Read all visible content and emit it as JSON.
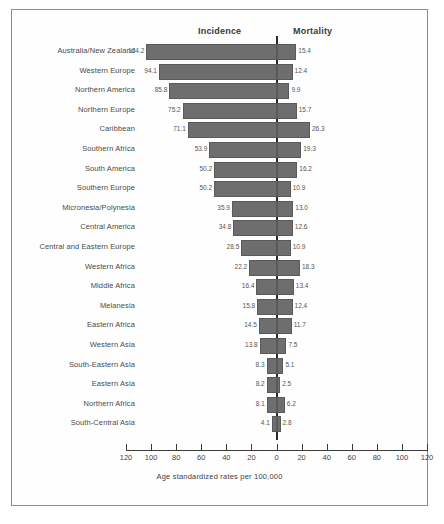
{
  "chart_data": {
    "type": "bar",
    "title": "",
    "subtitle": "",
    "orientation": "horizontal-diverging",
    "xlabel": "Age standardized rates per 100,000",
    "ylabel": "",
    "grid": false,
    "legend_position": "top",
    "axis_ticks": [
      "120",
      "100",
      "80",
      "60",
      "40",
      "20",
      "0",
      "20",
      "40",
      "60",
      "80",
      "100",
      "120"
    ],
    "xlim_left": [
      0,
      120
    ],
    "xlim_right": [
      0,
      120
    ],
    "categories": [
      "Australia/New Zealand",
      "Western Europe",
      "Northern America",
      "Northern Europe",
      "Caribbean",
      "Southern Africa",
      "South America",
      "Southern Europe",
      "Micronesia/Polynesia",
      "Central America",
      "Central and Eastern Europe",
      "Western Africa",
      "Middle Africa",
      "Melanesia",
      "Eastern Africa",
      "Western Asia",
      "South-Eastern Asia",
      "Eastern Asia",
      "Northern Africa",
      "South-Central Asia"
    ],
    "series": [
      {
        "name": "Incidence",
        "side": "left",
        "values": [
          104.2,
          94.1,
          85.8,
          75.2,
          71.1,
          53.9,
          50.2,
          50.2,
          35.9,
          34.8,
          28.5,
          22.2,
          16.4,
          15.8,
          14.5,
          13.8,
          8.3,
          8.2,
          8.1,
          4.1
        ]
      },
      {
        "name": "Mortality",
        "side": "right",
        "values": [
          15.4,
          12.4,
          9.9,
          15.7,
          26.3,
          19.3,
          16.2,
          10.9,
          13.0,
          12.6,
          10.9,
          18.3,
          13.4,
          12.4,
          11.7,
          7.5,
          5.1,
          2.5,
          6.2,
          2.8
        ]
      }
    ],
    "colors": {
      "bar_fill": "#6e6e6e",
      "bar_border": "#5a5a5a",
      "axis": "#2b2b2b",
      "text": "#4a4a4a",
      "frame": "#8d8d8d",
      "background": "#ffffff"
    }
  }
}
